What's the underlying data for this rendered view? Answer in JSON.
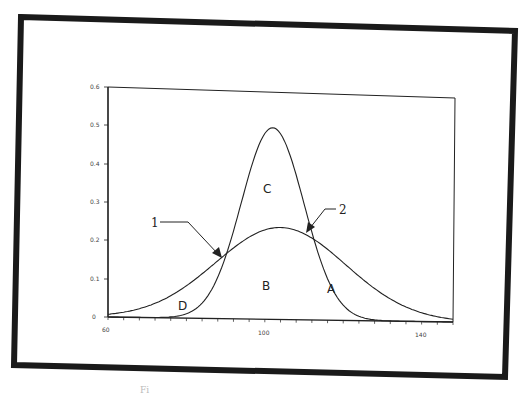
{
  "chart_data": {
    "type": "line",
    "title": "",
    "xlabel": "",
    "ylabel": "",
    "xlim": [
      60,
      148
    ],
    "ylim": [
      0,
      0.6
    ],
    "x_ticks": [
      "60",
      "100",
      "140"
    ],
    "y_ticks": [
      "0",
      "0.1",
      "0.2",
      "0.3",
      "0.4",
      "0.5",
      "0.6"
    ],
    "grid": false,
    "legend": null,
    "series": [
      {
        "name": "narrow curve",
        "distribution": "normal",
        "mean": 102,
        "sd": 8,
        "peak": 0.5,
        "x": [
          70,
          80,
          85,
          90,
          95,
          100,
          102,
          105,
          110,
          115,
          120,
          125,
          130
        ],
        "values": [
          0.002,
          0.011,
          0.052,
          0.162,
          0.341,
          0.485,
          0.5,
          0.466,
          0.304,
          0.133,
          0.04,
          0.008,
          0.001
        ]
      },
      {
        "name": "broad curve",
        "distribution": "normal",
        "mean": 104,
        "sd": 16.6,
        "peak": 0.24,
        "x": [
          60,
          70,
          80,
          90,
          95,
          100,
          104,
          110,
          115,
          120,
          130,
          140,
          145
        ],
        "values": [
          0.007,
          0.029,
          0.084,
          0.168,
          0.207,
          0.233,
          0.24,
          0.224,
          0.192,
          0.151,
          0.07,
          0.023,
          0.011
        ]
      }
    ],
    "annotations": [
      {
        "label": "C",
        "region": "inside narrow curve above broad curve"
      },
      {
        "label": "B",
        "region": "under both curves"
      },
      {
        "label": "A",
        "region": "right tail between curves"
      },
      {
        "label": "D",
        "region": "left tail between curves"
      },
      {
        "label": "1",
        "arrow_to": "left intersection (~x=92)"
      },
      {
        "label": "2",
        "arrow_to": "right intersection (~x=112)"
      }
    ]
  },
  "labels": {
    "region_c": "C",
    "region_b": "B",
    "region_a": "A",
    "region_d": "D",
    "callout_1": "1",
    "callout_2": "2",
    "x_tick_60": "60",
    "x_tick_100": "100",
    "x_tick_140": "140",
    "y_tick_0": "0",
    "y_tick_1": "0.1",
    "y_tick_2": "0.2",
    "y_tick_3": "0.3",
    "y_tick_4": "0.4",
    "y_tick_5": "0.5",
    "y_tick_6": "0.6",
    "caption_fragment": "Fi"
  }
}
